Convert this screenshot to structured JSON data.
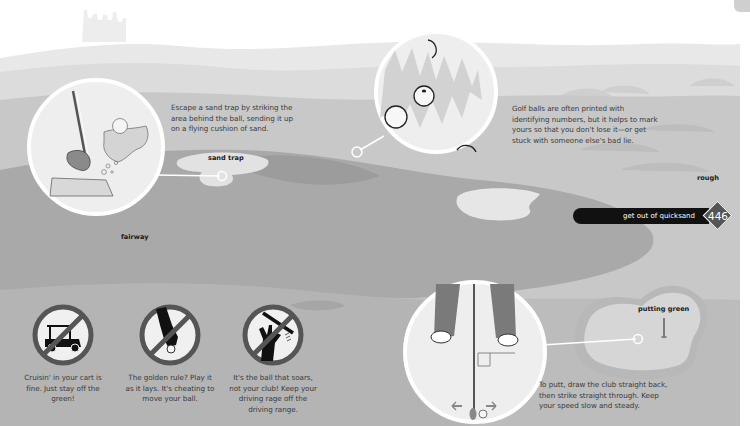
{
  "page": {
    "number": "446",
    "section_tab": "get out of quicksand",
    "theme_colors": {
      "sky": "#f6f6f6",
      "hills_far": "#e2e2e2",
      "rough": "#c4c4c4",
      "fairway": "#a8a8a8",
      "fairway_dark": "#9a9a9a",
      "sand": "#dedede",
      "green": "#d4d4d4",
      "pill": "#111111",
      "diamond": "#555555"
    }
  },
  "labels": {
    "sand_trap": "sand trap",
    "fairway": "fairway",
    "rough": "rough",
    "putting_green": "putting green"
  },
  "callouts": {
    "sand_trap": "Escape a sand trap by striking the area behind the ball, sending it up on a flying cushion of sand.",
    "golf_balls": "Golf balls are often printed with identifying numbers, but it helps to mark yours so that you don't lose it—or get stuck with someone else's bad lie.",
    "putting": "To putt, draw the club straight back, then strike straight through. Keep your speed slow and steady."
  },
  "rules": [
    {
      "icon": "golf-cart-prohibited-icon",
      "text": "Cruisin' in your cart is fine. Just stay off the green!"
    },
    {
      "icon": "hand-moving-ball-prohibited-icon",
      "text": "The golden rule? Play it as it lays. It's cheating to move your ball."
    },
    {
      "icon": "throwing-club-prohibited-icon",
      "text": "It's the ball that soars, not your club! Keep your driving rage off the driving range."
    }
  ]
}
